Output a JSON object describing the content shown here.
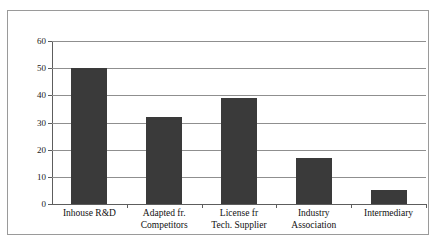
{
  "chart_data": {
    "type": "bar",
    "title": "",
    "xlabel": "",
    "ylabel": "",
    "categories": [
      "Inhouse R&D",
      "Adapted fr. Competitors",
      "License fr Tech. Supplier",
      "Industry Association",
      "Intermediary"
    ],
    "category_lines": [
      [
        "Inhouse R&D"
      ],
      [
        "Adapted fr.",
        "Competitors"
      ],
      [
        "License fr",
        "Tech. Supplier"
      ],
      [
        "Industry",
        "Association"
      ],
      [
        "Intermediary"
      ]
    ],
    "values": [
      50,
      32,
      39,
      17,
      5
    ],
    "ylim": [
      0,
      60
    ],
    "ytick_labels": [
      "0",
      "10",
      "20",
      "30",
      "40",
      "50",
      "60"
    ],
    "ytick_values": [
      0,
      10,
      20,
      30,
      40,
      50,
      60
    ],
    "grid": "horizontal",
    "legend": "none",
    "bar_color": "#3a3a3a",
    "gridline_color": "#8f8f8f",
    "axis_color": "#5d5d5d",
    "frame_color": "#9a9a9a",
    "background_color": "#ffffff"
  },
  "figure": {
    "caption": ""
  }
}
